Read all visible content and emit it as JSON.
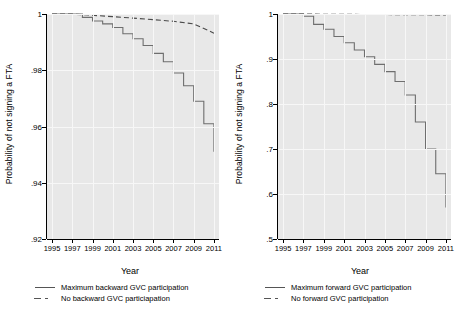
{
  "figure": {
    "width": 461,
    "height": 310,
    "background": "#ffffff",
    "plot_background": "#e8e8e8"
  },
  "chart_data": [
    {
      "panel": "left",
      "type": "line",
      "title": "",
      "xlabel": "Year",
      "ylabel": "Probability of not signing a FTA",
      "xlim": [
        1994.5,
        2011.5
      ],
      "ylim": [
        0.92,
        1.0
      ],
      "xticks": [
        1995,
        1997,
        1999,
        2001,
        2003,
        2005,
        2007,
        2009,
        2011
      ],
      "xticklabels": [
        "1995",
        "1997",
        "1999",
        "2001",
        "2003",
        "2005",
        "2007",
        "2009",
        "2011"
      ],
      "yticks": [
        0.92,
        0.94,
        0.96,
        0.98,
        1.0
      ],
      "yticklabels": [
        ".92",
        ".94",
        ".96",
        ".98",
        "1"
      ],
      "grid": true,
      "legend_position": "below",
      "series": [
        {
          "name": "Maximum backward GVC participation",
          "style": "solid",
          "color": "#6e6e6e",
          "step": true,
          "x": [
            1995,
            1996,
            1997,
            1998,
            1999,
            2000,
            2001,
            2002,
            2003,
            2004,
            2005,
            2006,
            2007,
            2008,
            2009,
            2010,
            2011
          ],
          "y": [
            1.0,
            1.0,
            1.0,
            0.9988,
            0.9975,
            0.9965,
            0.9952,
            0.993,
            0.9912,
            0.9888,
            0.986,
            0.983,
            0.979,
            0.9745,
            0.969,
            0.961,
            0.951
          ]
        },
        {
          "name": "No backward GVC particiapation",
          "style": "dashed",
          "color": "#4a4a4a",
          "step": false,
          "x": [
            1995,
            1997,
            1999,
            2001,
            2003,
            2005,
            2007,
            2009,
            2011
          ],
          "y": [
            1.0,
            0.99995,
            0.99955,
            0.99905,
            0.99855,
            0.998,
            0.9974,
            0.9965,
            0.9932
          ]
        }
      ],
      "legend": [
        {
          "label": "Maximum backward GVC participation",
          "style": "solid"
        },
        {
          "label": "No backward GVC particiapation",
          "style": "dashed"
        }
      ]
    },
    {
      "panel": "right",
      "type": "line",
      "title": "",
      "xlabel": "Year",
      "ylabel": "Probability of not signing a FTA",
      "xlim": [
        1994.5,
        2011.5
      ],
      "ylim": [
        0.5,
        1.0
      ],
      "xticks": [
        1995,
        1997,
        1999,
        2001,
        2003,
        2005,
        2007,
        2009,
        2011
      ],
      "xticklabels": [
        "1995",
        "1997",
        "1999",
        "2001",
        "2003",
        "2005",
        "2007",
        "2009",
        "2011"
      ],
      "yticks": [
        0.5,
        0.6,
        0.7,
        0.8,
        0.9,
        1.0
      ],
      "yticklabels": [
        ".5",
        ".6",
        ".7",
        ".8",
        ".9",
        "1"
      ],
      "grid": true,
      "legend_position": "below",
      "series": [
        {
          "name": "Maximum forward GVC participation",
          "style": "solid",
          "color": "#6e6e6e",
          "step": true,
          "x": [
            1995,
            1996,
            1997,
            1998,
            1999,
            2000,
            2001,
            2002,
            2003,
            2004,
            2005,
            2006,
            2007,
            2008,
            2009,
            2010,
            2011
          ],
          "y": [
            1.0,
            1.0,
            0.995,
            0.977,
            0.966,
            0.95,
            0.936,
            0.92,
            0.905,
            0.888,
            0.872,
            0.85,
            0.82,
            0.76,
            0.7,
            0.645,
            0.57
          ]
        },
        {
          "name": "No forward GVC participation",
          "style": "dashed",
          "color": "#4a4a4a",
          "step": false,
          "x": [
            1995,
            1997,
            1999,
            2001,
            2003,
            2005,
            2007,
            2009,
            2011
          ],
          "y": [
            1.0,
            0.9998,
            0.9995,
            0.9992,
            0.999,
            0.9988,
            0.9985,
            0.9982,
            0.9978
          ]
        }
      ],
      "legend": [
        {
          "label": "Maximum forward GVC participation",
          "style": "solid"
        },
        {
          "label": "No forward GVC participation",
          "style": "dashed"
        }
      ]
    }
  ]
}
